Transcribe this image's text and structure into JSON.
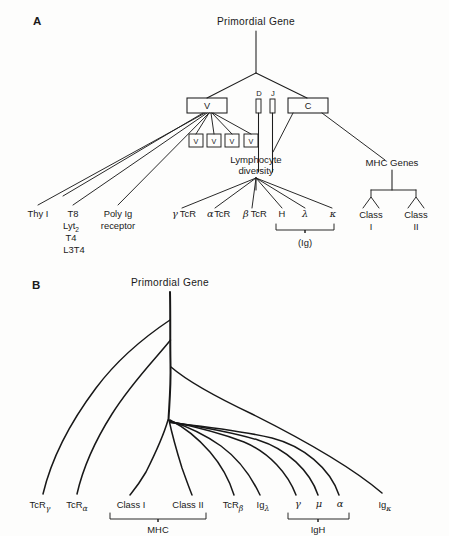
{
  "figure": {
    "background_color": "#fdfdfc",
    "ink_color": "#1a1a1a"
  },
  "panel_a": {
    "label": "A",
    "root_label": "Primordial Gene",
    "segment_boxes": [
      {
        "name": "V",
        "label": "V"
      },
      {
        "name": "D",
        "label": "D"
      },
      {
        "name": "J",
        "label": "J"
      },
      {
        "name": "C",
        "label": "C"
      }
    ],
    "v_repeat_boxes": [
      "V",
      "V",
      "V",
      "V"
    ],
    "diversity_node": {
      "line1": "Lymphocyte",
      "line2": "diversity"
    },
    "mhc_node": "MHC Genes",
    "left_leaves": [
      {
        "lines": [
          "Thy I"
        ]
      },
      {
        "lines": [
          "T8",
          "Lyt",
          "T4",
          "L3T4"
        ],
        "subscript_on": "Lyt",
        "subscript": "2"
      },
      {
        "lines": [
          "Poly Ig",
          "receptor"
        ]
      }
    ],
    "diversity_leaves": [
      {
        "greek": "γ",
        "text": "TcR"
      },
      {
        "greek": "α",
        "text": "TcR"
      },
      {
        "greek": "β",
        "text": "TcR"
      },
      {
        "greek": "",
        "text": "H"
      },
      {
        "greek": "λ",
        "text": ""
      },
      {
        "greek": "κ",
        "text": ""
      }
    ],
    "ig_bracket_label": "(Ig)",
    "mhc_leaves": [
      {
        "line1": "Class",
        "line2": "I"
      },
      {
        "line1": "Class",
        "line2": "II"
      }
    ]
  },
  "panel_b": {
    "label": "B",
    "root_label": "Primordial Gene",
    "leaves": [
      {
        "base": "TcR",
        "sub": "γ"
      },
      {
        "base": "TcR",
        "sub": "α"
      },
      {
        "base": "Class I",
        "sub": ""
      },
      {
        "base": "Class II",
        "sub": ""
      },
      {
        "base": "TcR",
        "sub": "β"
      },
      {
        "base": "Ig",
        "sub": "λ"
      },
      {
        "base": "γ",
        "sub": ""
      },
      {
        "base": "μ",
        "sub": ""
      },
      {
        "base": "α",
        "sub": ""
      },
      {
        "base": "Ig",
        "sub": "κ"
      }
    ],
    "brackets": [
      {
        "label": "MHC",
        "covers": [
          "Class I",
          "Class II"
        ]
      },
      {
        "label": "IgH",
        "covers": [
          "γ",
          "μ",
          "α"
        ]
      }
    ]
  }
}
